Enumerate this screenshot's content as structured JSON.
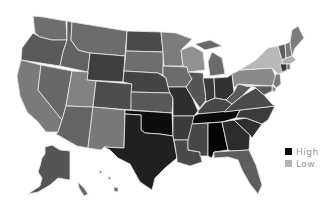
{
  "map": {
    "type": "choropleth",
    "region": "United States",
    "states": {
      "WA": "#6f6f6f",
      "OR": "#5a5a5a",
      "CA": "#7a7a7a",
      "ID": "#626262",
      "NV": "#686868",
      "MT": "#6c6c6c",
      "WY": "#3e3e3e",
      "UT": "#818181",
      "AZ": "#656565",
      "CO": "#4c4c4c",
      "NM": "#787878",
      "ND": "#4a4a4a",
      "SD": "#6e6e6e",
      "NE": "#444444",
      "KS": "#595959",
      "OK": "#0d0d0d",
      "TX": "#202020",
      "MN": "#7c7c7c",
      "IA": "#6d6d6d",
      "MO": "#2e2e2e",
      "AR": "#3b3b3b",
      "LA": "#494949",
      "WI": "#919191",
      "IL": "#555555",
      "MI": "#6a6a6a",
      "IN": "#3a3a3a",
      "OH": "#333333",
      "KY": "#484848",
      "TN": "#0a0a0a",
      "MS": "#474747",
      "AL": "#050505",
      "GA": "#2c2c2c",
      "FL": "#5e5e5e",
      "SC": "#2f2f2f",
      "NC": "#3c3c3c",
      "VA": "#4a4a4a",
      "WV": "#5c5c5c",
      "PA": "#8a8a8a",
      "NY": "#b8b8b8",
      "VT": "#5e5e5e",
      "NH": "#7a7a7a",
      "ME": "#7c7c7c",
      "MA": "#b0b0b0",
      "CT": "#3a3a3a",
      "RI": "#666666",
      "NJ": "#7a7a7a",
      "DE": "#8a8a8a",
      "MD": "#5a5a5a",
      "AK": "#555555",
      "HI": "#6a6a6a"
    }
  },
  "legend": {
    "items": [
      {
        "label": "High",
        "color": "#0a0a0a"
      },
      {
        "label": "Low",
        "color": "#b4b4b4"
      }
    ]
  }
}
